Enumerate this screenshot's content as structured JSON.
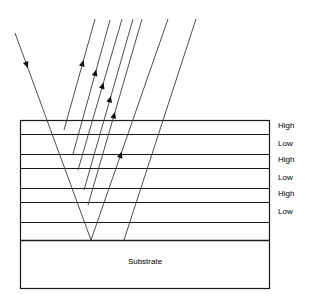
{
  "diagram": {
    "colors": {
      "stroke": "#1a1a1a",
      "ray": "#3a3a3a",
      "background": "#ffffff",
      "text": "#000000"
    },
    "stack": {
      "left": 20,
      "right": 269,
      "top": 120,
      "bottom": 288,
      "boundaries": [
        120,
        134,
        154,
        168,
        188,
        202,
        222,
        240,
        288
      ]
    },
    "layers": [
      {
        "label": "High",
        "index_type": "high",
        "top": 120,
        "bottom": 134,
        "label_y": 122
      },
      {
        "label": "Low",
        "index_type": "low",
        "top": 134,
        "bottom": 154,
        "label_y": 140
      },
      {
        "label": "High",
        "index_type": "high",
        "top": 154,
        "bottom": 168,
        "label_y": 156
      },
      {
        "label": "Low",
        "index_type": "low",
        "top": 168,
        "bottom": 188,
        "label_y": 174
      },
      {
        "label": "High",
        "index_type": "high",
        "top": 188,
        "bottom": 202,
        "label_y": 190
      },
      {
        "label": "Low",
        "index_type": "low",
        "top": 202,
        "bottom": 222,
        "label_y": 208
      }
    ],
    "substrate": {
      "label": "Substrate",
      "top": 240,
      "bottom": 288,
      "label_x": 145,
      "label_y": 258
    },
    "incident_ray": {
      "name": "incident-ray",
      "x1": 15,
      "y1": 33,
      "x2": 91,
      "y2": 240,
      "arrow_at": 0.17
    },
    "reflected_rays": [
      {
        "name": "reflected-ray-1",
        "x1": 64,
        "y1": 130,
        "x2": 95,
        "y2": 19,
        "arrow_at": 0.63
      },
      {
        "name": "reflected-ray-2",
        "x1": 73,
        "y1": 154,
        "x2": 110,
        "y2": 20,
        "arrow_at": 0.63
      },
      {
        "name": "reflected-ray-3",
        "x1": 78,
        "y1": 170,
        "x2": 122,
        "y2": 19,
        "arrow_at": 0.58
      },
      {
        "name": "reflected-ray-4",
        "x1": 84,
        "y1": 190,
        "x2": 133,
        "y2": 19,
        "arrow_at": 0.55
      },
      {
        "name": "reflected-ray-5",
        "x1": 88,
        "y1": 205,
        "x2": 142,
        "y2": 19,
        "arrow_at": 0.5
      },
      {
        "name": "reflected-ray-6",
        "x1": 91,
        "y1": 240,
        "x2": 168,
        "y2": 19,
        "arrow_at": 0.4
      }
    ],
    "extra_rays": [
      {
        "name": "reflected-ray-7",
        "x1": 124,
        "y1": 240,
        "x2": 196,
        "y2": 19
      }
    ]
  }
}
